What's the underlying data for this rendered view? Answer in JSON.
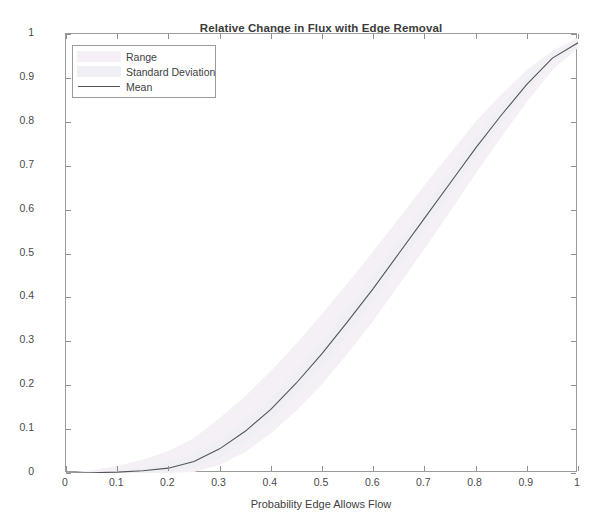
{
  "chart_data": {
    "type": "line",
    "title": "Relative Change in Flux with Edge Removal",
    "xlabel": "Probability Edge Allows Flow",
    "ylabel": "Relative Change in Flux",
    "xlim": [
      0,
      1
    ],
    "ylim": [
      0,
      1
    ],
    "grid": false,
    "legend_position": "upper left",
    "xticks": [
      "0",
      "0.1",
      "0.2",
      "0.3",
      "0.4",
      "0.5",
      "0.6",
      "0.7",
      "0.8",
      "0.9",
      "1"
    ],
    "xtick_values": [
      0,
      0.1,
      0.2,
      0.3,
      0.4,
      0.5,
      0.6,
      0.7,
      0.8,
      0.9,
      1
    ],
    "yticks": [
      "0",
      "0.1",
      "0.2",
      "0.3",
      "0.4",
      "0.5",
      "0.6",
      "0.7",
      "0.8",
      "0.9",
      "1"
    ],
    "ytick_values": [
      0,
      0.1,
      0.2,
      0.3,
      0.4,
      0.5,
      0.6,
      0.7,
      0.8,
      0.9,
      1
    ],
    "legend": [
      {
        "label": "Range",
        "kind": "band",
        "color": "#f4f0f5"
      },
      {
        "label": "Standard Deviation",
        "kind": "band",
        "color": "#efeff4"
      },
      {
        "label": "Mean",
        "kind": "line",
        "color": "#565656"
      }
    ],
    "x": [
      0,
      0.05,
      0.1,
      0.15,
      0.2,
      0.25,
      0.3,
      0.35,
      0.4,
      0.45,
      0.5,
      0.55,
      0.6,
      0.65,
      0.7,
      0.75,
      0.8,
      0.85,
      0.9,
      0.95,
      1
    ],
    "series": [
      {
        "name": "Mean",
        "color": "#565656",
        "values": [
          0,
          0.0005,
          0.002,
          0.005,
          0.011,
          0.026,
          0.055,
          0.095,
          0.145,
          0.205,
          0.272,
          0.345,
          0.42,
          0.5,
          0.58,
          0.66,
          0.74,
          0.815,
          0.885,
          0.945,
          0.98
        ]
      },
      {
        "name": "Standard Deviation upper",
        "color": "#efeff4",
        "values": [
          0,
          0.002,
          0.006,
          0.012,
          0.022,
          0.042,
          0.075,
          0.118,
          0.17,
          0.232,
          0.3,
          0.373,
          0.448,
          0.527,
          0.606,
          0.684,
          0.762,
          0.834,
          0.9,
          0.955,
          0.985
        ]
      },
      {
        "name": "Standard Deviation lower",
        "color": "#efeff4",
        "values": [
          0,
          0,
          0,
          0,
          0.002,
          0.011,
          0.035,
          0.072,
          0.12,
          0.178,
          0.244,
          0.317,
          0.392,
          0.473,
          0.554,
          0.636,
          0.718,
          0.796,
          0.87,
          0.935,
          0.975
        ]
      },
      {
        "name": "Range upper",
        "color": "#f4f0f5",
        "values": [
          0,
          0.006,
          0.016,
          0.03,
          0.05,
          0.08,
          0.125,
          0.175,
          0.232,
          0.295,
          0.362,
          0.432,
          0.505,
          0.58,
          0.655,
          0.728,
          0.8,
          0.862,
          0.918,
          0.962,
          0.992
        ]
      },
      {
        "name": "Range lower",
        "color": "#f4f0f5",
        "values": [
          0,
          0,
          0,
          0,
          0,
          0.002,
          0.018,
          0.048,
          0.09,
          0.142,
          0.202,
          0.272,
          0.346,
          0.428,
          0.51,
          0.595,
          0.682,
          0.765,
          0.845,
          0.918,
          0.968
        ]
      }
    ]
  }
}
